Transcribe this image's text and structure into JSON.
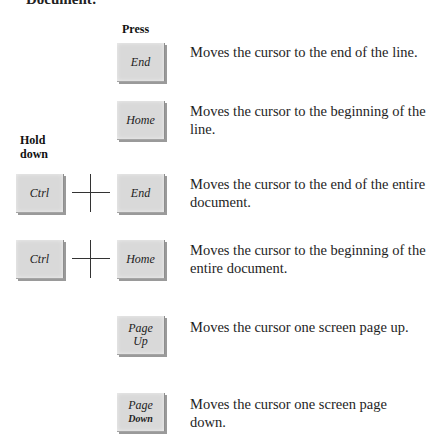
{
  "page": {
    "cut_heading": "Document:"
  },
  "headers": {
    "press": "Press",
    "hold_down_line1": "Hold",
    "hold_down_line2": "down"
  },
  "rows": [
    {
      "hold": null,
      "key_lines": [
        "End"
      ],
      "description": "Moves the cursor to the end of the line."
    },
    {
      "hold": null,
      "key_lines": [
        "Home"
      ],
      "description": "Moves the cursor to the beginning of the line."
    },
    {
      "hold": "Ctrl",
      "key_lines": [
        "End"
      ],
      "description": "Moves the cursor to the end of the entire document."
    },
    {
      "hold": "Ctrl",
      "key_lines": [
        "Home"
      ],
      "description": "Moves the cursor to the beginning of the entire document."
    },
    {
      "hold": null,
      "key_lines": [
        "Page",
        "Up"
      ],
      "description": "Moves the cursor one screen page up."
    },
    {
      "hold": null,
      "key_lines": [
        "Page",
        "Down"
      ],
      "description": "Moves the cursor one screen page down."
    }
  ],
  "colors": {
    "key_fill": "#d9d9d9",
    "key_shadow": "#9a9a9a",
    "text": "#1e1e1e"
  }
}
